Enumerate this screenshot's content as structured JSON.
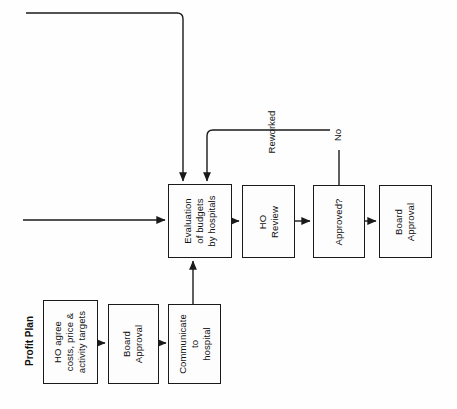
{
  "diagram": {
    "group_label": "Profit Plan",
    "text_orientation": "rotated-90-ccw",
    "stroke_color": "#1a1a1a",
    "background_color": "#fefefe",
    "boxes": [
      {
        "id": "ho-agree",
        "label": "HO agree\ncosts, price &\nactivity targets",
        "x": 43,
        "y": 300,
        "w": 55,
        "h": 84
      },
      {
        "id": "board-approval-1",
        "label": "Board\nApproval",
        "x": 108,
        "y": 304,
        "w": 51,
        "h": 80
      },
      {
        "id": "communicate",
        "label": "Communicate\nto\nhospital",
        "x": 168,
        "y": 304,
        "w": 53,
        "h": 80
      },
      {
        "id": "evaluation",
        "label": "Evaluation\nof budgets\nby hospitals",
        "x": 168,
        "y": 184,
        "w": 64,
        "h": 74
      },
      {
        "id": "ho-review",
        "label": "HO\nReview",
        "x": 242,
        "y": 185,
        "w": 53,
        "h": 73
      },
      {
        "id": "approved",
        "label": "Approved?",
        "x": 313,
        "y": 185,
        "w": 52,
        "h": 73
      },
      {
        "id": "board-approval-2",
        "label": "Board\nApproval",
        "x": 379,
        "y": 185,
        "w": 53,
        "h": 73
      }
    ],
    "edge_labels": [
      {
        "id": "reworked",
        "text": "Reworked",
        "x": 272,
        "y": 131
      },
      {
        "id": "no",
        "text": "No",
        "x": 338,
        "y": 134
      }
    ]
  }
}
